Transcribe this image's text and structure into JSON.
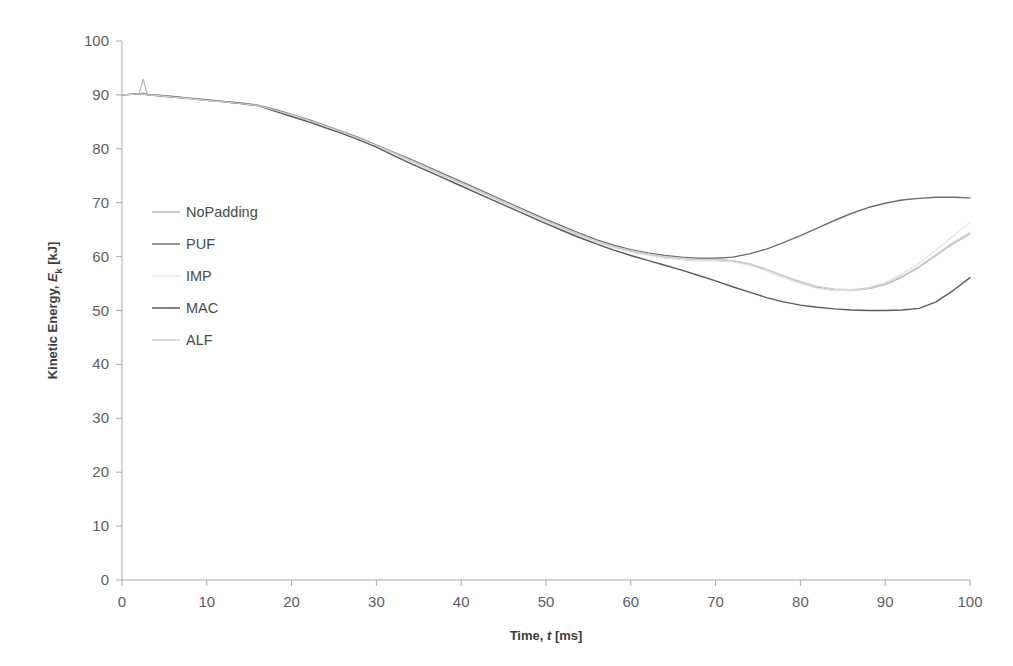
{
  "chart_data": {
    "type": "line",
    "title": "",
    "xlabel": "Time, t [ms]",
    "xlabel_parts": {
      "pre": "Time, ",
      "italic": "t",
      "post": " [ms]"
    },
    "ylabel": "Kinetic Energy, Eₖ [kJ]",
    "ylabel_parts": {
      "pre": "Kinetic Energy, ",
      "italic": "E",
      "sub": "k",
      "post": " [kJ]"
    },
    "xlim": [
      0,
      100
    ],
    "ylim": [
      0,
      100
    ],
    "xticks": [
      0,
      10,
      20,
      30,
      40,
      50,
      60,
      70,
      80,
      90,
      100
    ],
    "yticks": [
      0,
      10,
      20,
      30,
      40,
      50,
      60,
      70,
      80,
      90,
      100
    ],
    "grid": false,
    "legend_position": "inside-upper-left",
    "x": [
      0,
      1,
      2,
      2.5,
      3,
      4,
      6,
      8,
      10,
      12,
      14,
      16,
      18,
      20,
      22,
      24,
      26,
      28,
      30,
      32,
      34,
      36,
      38,
      40,
      42,
      44,
      46,
      48,
      50,
      52,
      54,
      56,
      58,
      60,
      62,
      64,
      66,
      68,
      70,
      72,
      74,
      76,
      78,
      80,
      82,
      84,
      86,
      88,
      90,
      92,
      94,
      96,
      98,
      100
    ],
    "series": [
      {
        "name": "NoPadding",
        "color": "#b9b9b9",
        "width": 1.2,
        "values": [
          90.0,
          90.1,
          90.2,
          92.9,
          90.0,
          89.9,
          89.6,
          89.3,
          89.0,
          88.7,
          88.4,
          88.0,
          87.2,
          86.3,
          85.3,
          84.2,
          83.1,
          81.9,
          80.6,
          79.2,
          77.8,
          76.4,
          75.0,
          73.6,
          72.2,
          70.8,
          69.4,
          68.0,
          66.6,
          65.3,
          64.0,
          62.8,
          61.8,
          61.0,
          60.4,
          59.9,
          59.6,
          59.4,
          59.4,
          59.2,
          58.6,
          57.6,
          56.4,
          55.2,
          54.3,
          53.8,
          53.7,
          54.0,
          54.8,
          56.2,
          58.0,
          60.2,
          62.4,
          64.2
        ]
      },
      {
        "name": "PUF",
        "color": "#6e6e6e",
        "width": 1.4,
        "values": [
          90.0,
          90.1,
          90.2,
          90.3,
          90.1,
          90.0,
          89.7,
          89.4,
          89.1,
          88.8,
          88.5,
          88.1,
          87.3,
          86.4,
          85.4,
          84.3,
          83.2,
          82.0,
          80.7,
          79.4,
          78.1,
          76.7,
          75.3,
          73.9,
          72.5,
          71.1,
          69.7,
          68.3,
          66.9,
          65.6,
          64.3,
          63.1,
          62.1,
          61.3,
          60.7,
          60.2,
          59.9,
          59.7,
          59.7,
          59.9,
          60.5,
          61.4,
          62.6,
          63.9,
          65.3,
          66.7,
          68.0,
          69.1,
          69.9,
          70.5,
          70.8,
          71.0,
          71.0,
          70.9
        ]
      },
      {
        "name": "IMP",
        "color": "#e2e2e2",
        "width": 1.2,
        "values": [
          90.0,
          90.1,
          90.2,
          90.2,
          90.0,
          89.9,
          89.6,
          89.3,
          89.0,
          88.7,
          88.4,
          88.0,
          87.1,
          86.2,
          85.2,
          84.1,
          83.0,
          81.8,
          80.5,
          79.1,
          77.6,
          76.2,
          74.8,
          73.4,
          72.0,
          70.6,
          69.2,
          67.8,
          66.4,
          65.1,
          63.8,
          62.6,
          61.6,
          60.8,
          60.2,
          59.7,
          59.4,
          59.2,
          59.2,
          59.0,
          58.4,
          57.3,
          56.1,
          55.0,
          54.1,
          53.7,
          53.7,
          54.2,
          55.2,
          56.8,
          58.8,
          61.2,
          63.8,
          66.4
        ]
      },
      {
        "name": "MAC",
        "color": "#5a5a5a",
        "width": 1.4,
        "values": [
          90.0,
          90.1,
          90.2,
          90.2,
          90.0,
          89.9,
          89.6,
          89.3,
          89.0,
          88.7,
          88.4,
          88.0,
          87.0,
          86.0,
          85.0,
          83.9,
          82.8,
          81.6,
          80.3,
          78.8,
          77.3,
          75.9,
          74.5,
          73.1,
          71.7,
          70.3,
          68.9,
          67.5,
          66.1,
          64.8,
          63.5,
          62.3,
          61.2,
          60.2,
          59.3,
          58.4,
          57.5,
          56.5,
          55.5,
          54.4,
          53.4,
          52.4,
          51.6,
          51.0,
          50.6,
          50.3,
          50.1,
          50.0,
          50.0,
          50.1,
          50.4,
          51.6,
          53.7,
          56.1
        ]
      },
      {
        "name": "ALF",
        "color": "#cfcfcf",
        "width": 1.2,
        "values": [
          90.0,
          90.1,
          90.2,
          90.2,
          90.0,
          89.9,
          89.6,
          89.3,
          89.0,
          88.7,
          88.4,
          88.0,
          87.2,
          86.3,
          85.3,
          84.2,
          83.1,
          81.9,
          80.6,
          79.3,
          77.9,
          76.5,
          75.1,
          73.7,
          72.3,
          70.9,
          69.5,
          68.1,
          66.7,
          65.4,
          64.1,
          62.9,
          61.9,
          61.1,
          60.5,
          60.0,
          59.7,
          59.5,
          59.5,
          59.3,
          58.7,
          57.7,
          56.5,
          55.4,
          54.5,
          54.0,
          53.9,
          54.2,
          55.0,
          56.4,
          58.2,
          60.4,
          62.6,
          64.5
        ]
      }
    ]
  },
  "legend": {
    "items": [
      {
        "label": "NoPadding",
        "color": "#b9b9b9"
      },
      {
        "label": "PUF",
        "color": "#6e6e6e"
      },
      {
        "label": "IMP",
        "color": "#e8e8e8"
      },
      {
        "label": "MAC",
        "color": "#5a5a5a"
      },
      {
        "label": "ALF",
        "color": "#cfcfcf"
      }
    ]
  }
}
